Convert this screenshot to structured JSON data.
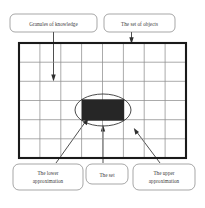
{
  "figure": {
    "background_color": "#ffffff"
  },
  "labels": {
    "granules": {
      "line1": "Granules of knowledge",
      "line2": ""
    },
    "set_of_objects": {
      "line1": "The set of objects",
      "line2": ""
    },
    "lower_approximation": {
      "line1": "The lower",
      "line2": "approximation"
    },
    "the_set": {
      "line1": "The set",
      "line2": ""
    },
    "upper_approximation": {
      "line1": "The upper",
      "line2": "approximation"
    }
  },
  "diagram": {
    "grid": {
      "columns": 8,
      "rows": 6,
      "border_color": "#1a1a1a",
      "line_color": "#8f8f8f"
    },
    "universe_rect": {
      "x": 19,
      "y": 43,
      "width": 167,
      "height": 115
    },
    "upper_approx_ellipse": {
      "cx": 103,
      "cy": 110,
      "rx": 28,
      "ry": 16,
      "stroke_color": "#2b2b2b"
    },
    "lower_approx_rect": {
      "x": 82,
      "y": 99,
      "width": 42,
      "height": 21,
      "fill_color": "#262626"
    }
  },
  "connectors": [
    {
      "name": "granules-arrow",
      "from": "granules-callout",
      "to": "grid-cell",
      "direction": "down"
    },
    {
      "name": "set-of-objects-arrow",
      "from": "set-of-objects-callout",
      "to": "grid-top-border",
      "direction": "down"
    },
    {
      "name": "lower-approximation-arrow",
      "from": "lower-approximation-callout",
      "to": "black-rectangle",
      "direction": "up-right"
    },
    {
      "name": "the-set-arrow",
      "from": "the-set-callout",
      "to": "ellipse-bottom",
      "direction": "up"
    },
    {
      "name": "upper-approximation-arrow",
      "from": "upper-approximation-callout",
      "to": "grid-cell-right",
      "direction": "up-left"
    }
  ]
}
